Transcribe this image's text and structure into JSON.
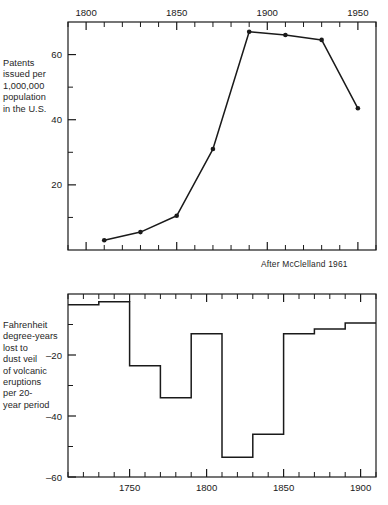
{
  "figure": {
    "top": {
      "ylabel": "Patents\nissued per\n1,000,000\npopulation\nin the U.S.",
      "credit": "After McClelland 1961"
    },
    "bottom": {
      "ylabel": "Fahrenheit\ndegree-years\nlost to\ndust veil\nof volcanic\neruptions\nper 20-\nyear period"
    },
    "caption_partial": ""
  },
  "chart_data": [
    {
      "type": "line",
      "title": "",
      "xlabel": "",
      "ylabel": "Patents issued per 1,000,000 population in the U.S.",
      "annotation": "After McClelland 1961",
      "axis_position": {
        "x": "top",
        "y": "left"
      },
      "xlim": [
        1790,
        1960
      ],
      "ylim": [
        0,
        70
      ],
      "xticks_major": [
        1800,
        1850,
        1900,
        1950
      ],
      "xticks_major_labels": [
        "1800",
        "1850",
        "1900",
        "1950"
      ],
      "xticks_minor_step": 10,
      "yticks_major": [
        20,
        40,
        60
      ],
      "yticks_major_labels": [
        "20",
        "40",
        "60"
      ],
      "yticks_minor": [
        10,
        30,
        50
      ],
      "grid": false,
      "legend": "none",
      "marker": "filled-circle",
      "x": [
        1810,
        1830,
        1850,
        1870,
        1890,
        1910,
        1930,
        1950
      ],
      "y": [
        3.0,
        5.5,
        10.5,
        31.0,
        67.0,
        66.0,
        64.5,
        43.5
      ],
      "points": [
        {
          "x": 1810,
          "y": 3.0
        },
        {
          "x": 1830,
          "y": 5.5
        },
        {
          "x": 1850,
          "y": 10.5
        },
        {
          "x": 1870,
          "y": 31.0
        },
        {
          "x": 1890,
          "y": 67.0
        },
        {
          "x": 1910,
          "y": 66.0
        },
        {
          "x": 1930,
          "y": 64.5
        },
        {
          "x": 1950,
          "y": 43.5
        }
      ]
    },
    {
      "type": "bar",
      "subtype": "step",
      "title": "",
      "xlabel": "",
      "ylabel": "Fahrenheit degree-years lost to dust veil of volcanic eruptions per 20-year period",
      "axis_position": {
        "x": "bottom",
        "y": "left"
      },
      "xlim": [
        1710,
        1910
      ],
      "ylim": [
        -60,
        0
      ],
      "xticks_major": [
        1750,
        1800,
        1850,
        1900
      ],
      "xticks_major_labels": [
        "1750",
        "1800",
        "1850",
        "1900"
      ],
      "xticks_minor_step": 10,
      "yticks_major": [
        -20,
        -40,
        -60
      ],
      "yticks_major_labels": [
        "-20",
        "-40",
        "-60"
      ],
      "yticks_minor": [
        -10,
        -30,
        -50
      ],
      "grid": false,
      "legend": "none",
      "categories": [
        "1710-1730",
        "1730-1750",
        "1750-1770",
        "1770-1790",
        "1790-1810",
        "1810-1830",
        "1830-1850",
        "1850-1870",
        "1870-1890",
        "1890-1910"
      ],
      "values": [
        -3.5,
        -2.5,
        -23.5,
        -34.0,
        -13.0,
        -53.5,
        -46.0,
        -13.0,
        -11.5,
        -9.5
      ],
      "steps": [
        {
          "period": "1710-1730",
          "start": 1710,
          "end": 1730,
          "value": -3.5
        },
        {
          "period": "1730-1750",
          "start": 1730,
          "end": 1750,
          "value": -2.5
        },
        {
          "period": "1750-1770",
          "start": 1750,
          "end": 1770,
          "value": -23.5
        },
        {
          "period": "1770-1790",
          "start": 1770,
          "end": 1790,
          "value": -34.0
        },
        {
          "period": "1790-1810",
          "start": 1790,
          "end": 1810,
          "value": -13.0
        },
        {
          "period": "1810-1830",
          "start": 1810,
          "end": 1830,
          "value": -53.5
        },
        {
          "period": "1830-1850",
          "start": 1830,
          "end": 1850,
          "value": -46.0
        },
        {
          "period": "1850-1870",
          "start": 1850,
          "end": 1870,
          "value": -13.0
        },
        {
          "period": "1870-1890",
          "start": 1870,
          "end": 1890,
          "value": -11.5
        },
        {
          "period": "1890-1910",
          "start": 1890,
          "end": 1910,
          "value": -9.5
        }
      ]
    }
  ],
  "colors": {
    "line": "#1a1a1a",
    "axis": "#1a1a1a",
    "text": "#262626",
    "background": "#ffffff"
  }
}
